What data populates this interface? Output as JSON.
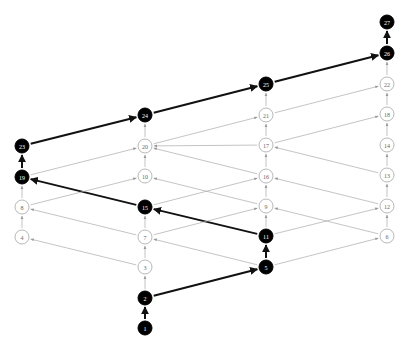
{
  "diagram": {
    "type": "directed-lattice",
    "colors": {
      "highlight_fill": "#000000",
      "highlight_text": "#ffffff",
      "normal_stroke": "#999999",
      "normal_text": "#666666",
      "normal_edge": "#aaaaaa",
      "highlight_edge": "#111111"
    },
    "nodes": [
      {
        "id": "1",
        "x": 145,
        "y": 328,
        "highlight": true
      },
      {
        "id": "2",
        "x": 145,
        "y": 298,
        "highlight": true
      },
      {
        "id": "3",
        "x": 145,
        "y": 267,
        "highlight": false
      },
      {
        "id": "7",
        "x": 145,
        "y": 237,
        "highlight": false
      },
      {
        "id": "15",
        "x": 145,
        "y": 207,
        "highlight": true
      },
      {
        "id": "10",
        "x": 145,
        "y": 176,
        "highlight": false
      },
      {
        "id": "20",
        "x": 145,
        "y": 146,
        "highlight": false
      },
      {
        "id": "24",
        "x": 145,
        "y": 115,
        "highlight": true
      },
      {
        "id": "4",
        "x": 22,
        "y": 237,
        "highlight": false
      },
      {
        "id": "8",
        "x": 22,
        "y": 207,
        "highlight": false
      },
      {
        "id": "19",
        "x": 22,
        "y": 177,
        "highlight": true
      },
      {
        "id": "23",
        "x": 22,
        "y": 146,
        "highlight": true
      },
      {
        "id": "5",
        "x": 266,
        "y": 267,
        "highlight": true
      },
      {
        "id": "11",
        "x": 266,
        "y": 236,
        "highlight": true
      },
      {
        "id": "9",
        "x": 266,
        "y": 206,
        "highlight": false
      },
      {
        "id": "16",
        "x": 266,
        "y": 176,
        "highlight": false
      },
      {
        "id": "17",
        "x": 266,
        "y": 145,
        "highlight": false
      },
      {
        "id": "21",
        "x": 266,
        "y": 115,
        "highlight": false
      },
      {
        "id": "25",
        "x": 266,
        "y": 84,
        "highlight": true
      },
      {
        "id": "6",
        "x": 387,
        "y": 236,
        "highlight": false
      },
      {
        "id": "12",
        "x": 387,
        "y": 206,
        "highlight": false
      },
      {
        "id": "13",
        "x": 387,
        "y": 175,
        "highlight": false
      },
      {
        "id": "14",
        "x": 387,
        "y": 145,
        "highlight": false
      },
      {
        "id": "18",
        "x": 387,
        "y": 114,
        "highlight": false
      },
      {
        "id": "22",
        "x": 387,
        "y": 84,
        "highlight": false
      },
      {
        "id": "26",
        "x": 387,
        "y": 53,
        "highlight": true
      },
      {
        "id": "27",
        "x": 387,
        "y": 22,
        "highlight": true
      }
    ],
    "edges": [
      {
        "from": "1",
        "to": "2",
        "highlight": true
      },
      {
        "from": "2",
        "to": "5",
        "highlight": true
      },
      {
        "from": "5",
        "to": "11",
        "highlight": true
      },
      {
        "from": "11",
        "to": "15",
        "highlight": true
      },
      {
        "from": "15",
        "to": "19",
        "highlight": true
      },
      {
        "from": "19",
        "to": "23",
        "highlight": true
      },
      {
        "from": "23",
        "to": "24",
        "highlight": true
      },
      {
        "from": "24",
        "to": "25",
        "highlight": true
      },
      {
        "from": "25",
        "to": "26",
        "highlight": true
      },
      {
        "from": "26",
        "to": "27",
        "highlight": true
      },
      {
        "from": "2",
        "to": "3",
        "highlight": false
      },
      {
        "from": "3",
        "to": "7",
        "highlight": false
      },
      {
        "from": "7",
        "to": "15",
        "highlight": false
      },
      {
        "from": "10",
        "to": "20",
        "highlight": false
      },
      {
        "from": "20",
        "to": "24",
        "highlight": false
      },
      {
        "from": "3",
        "to": "4",
        "highlight": false
      },
      {
        "from": "4",
        "to": "8",
        "highlight": false
      },
      {
        "from": "8",
        "to": "19",
        "highlight": false
      },
      {
        "from": "7",
        "to": "8",
        "highlight": false
      },
      {
        "from": "8",
        "to": "10",
        "highlight": false
      },
      {
        "from": "19",
        "to": "20",
        "highlight": false
      },
      {
        "from": "5",
        "to": "7",
        "highlight": false
      },
      {
        "from": "7",
        "to": "9",
        "highlight": false
      },
      {
        "from": "9",
        "to": "10",
        "highlight": false
      },
      {
        "from": "15",
        "to": "16",
        "highlight": false
      },
      {
        "from": "16",
        "to": "20",
        "highlight": false
      },
      {
        "from": "20",
        "to": "21",
        "highlight": false
      },
      {
        "from": "17",
        "to": "20",
        "highlight": false
      },
      {
        "from": "11",
        "to": "9",
        "highlight": false
      },
      {
        "from": "9",
        "to": "16",
        "highlight": false
      },
      {
        "from": "16",
        "to": "17",
        "highlight": false
      },
      {
        "from": "17",
        "to": "21",
        "highlight": false
      },
      {
        "from": "21",
        "to": "25",
        "highlight": false
      },
      {
        "from": "5",
        "to": "6",
        "highlight": false
      },
      {
        "from": "11",
        "to": "12",
        "highlight": false
      },
      {
        "from": "6",
        "to": "9",
        "highlight": false
      },
      {
        "from": "6",
        "to": "12",
        "highlight": false
      },
      {
        "from": "12",
        "to": "13",
        "highlight": false
      },
      {
        "from": "12",
        "to": "16",
        "highlight": false
      },
      {
        "from": "13",
        "to": "14",
        "highlight": false
      },
      {
        "from": "13",
        "to": "17",
        "highlight": false
      },
      {
        "from": "14",
        "to": "18",
        "highlight": false
      },
      {
        "from": "17",
        "to": "18",
        "highlight": false
      },
      {
        "from": "18",
        "to": "22",
        "highlight": false
      },
      {
        "from": "21",
        "to": "22",
        "highlight": false
      },
      {
        "from": "22",
        "to": "26",
        "highlight": false
      }
    ]
  }
}
